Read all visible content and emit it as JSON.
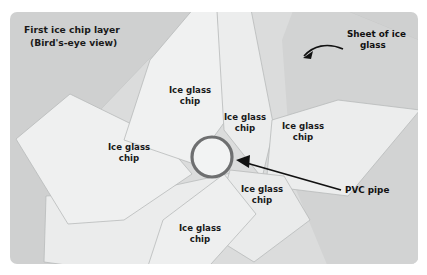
{
  "figure": {
    "name": "ice-chip-layer-diagram",
    "background_color": "#ffffff",
    "panel_color": "#cfd0d0",
    "panel_color_light": "#d9dada",
    "chip_fill": "#eeeff0",
    "chip_stroke": "#b9bbbb",
    "sheet_fill": "#e4e5e6",
    "pipe_stroke": "#6e6f70",
    "text_color": "#1a1a1a"
  },
  "title": {
    "line1": "First ice chip layer",
    "line2": "(Bird's-eye view)"
  },
  "callouts": [
    {
      "id": "sheet-of-ice-glass",
      "line1": "Sheet of ice",
      "line2": "glass"
    },
    {
      "id": "pvc-pipe",
      "line1": "PVC pipe",
      "line2": ""
    }
  ],
  "chip_labels": [
    {
      "id": "chip-top-center",
      "line1": "Ice glass",
      "line2": "chip",
      "x": 190,
      "y": 93
    },
    {
      "id": "chip-center-right",
      "line1": "Ice glass",
      "line2": "chip",
      "x": 245,
      "y": 120
    },
    {
      "id": "chip-right",
      "line1": "Ice glass",
      "line2": "chip",
      "x": 303,
      "y": 129
    },
    {
      "id": "chip-left",
      "line1": "Ice glass",
      "line2": "chip",
      "x": 129,
      "y": 150
    },
    {
      "id": "chip-lower-right",
      "line1": "Ice glass",
      "line2": "chip",
      "x": 262,
      "y": 192
    },
    {
      "id": "chip-bottom",
      "line1": "Ice glass",
      "line2": "chip",
      "x": 200,
      "y": 231
    }
  ],
  "pvc_pipe": {
    "label": "PVC pipe",
    "center_x": 212,
    "center_y": 157,
    "radius": 20,
    "stroke_width": 3.2
  },
  "shapes": {
    "panel": {
      "x": 10,
      "y": 12,
      "width": 408,
      "height": 252,
      "rx": 7
    },
    "sheet_polygon": "60,152 148,60 233,0 246,0 300,0 418,36 418,264 300,264 150,264 60,236",
    "chips": [
      {
        "id": "chip-left-big",
        "points": "18,140 68,96 160,140 188,178 120,218 70,224"
      },
      {
        "id": "chip-top-center-big",
        "points": "148,60 205,0 214,0 224,122 190,160 122,141"
      },
      {
        "id": "chip-center-right-tall",
        "points": "214,0 246,0 272,127 262,176 226,132"
      },
      {
        "id": "chip-right-wedge",
        "points": "272,122 336,102 418,112 345,195 268,186"
      },
      {
        "id": "chip-lower-right",
        "points": "232,172 280,178 306,218 256,260 215,238"
      },
      {
        "id": "chip-bottom-wide",
        "points": "60,198 150,192 232,174 218,250 150,275 60,258"
      },
      {
        "id": "chip-bottom-diamond",
        "points": "165,218 222,176 254,216 200,272 150,266"
      }
    ]
  }
}
